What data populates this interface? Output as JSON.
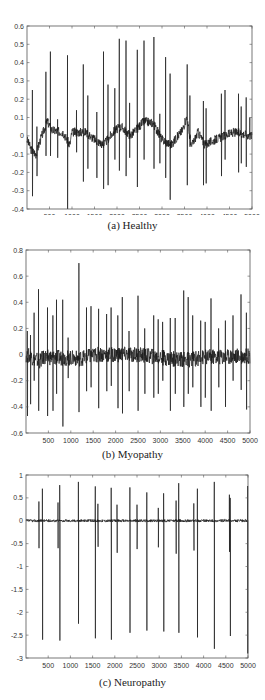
{
  "chart_data": [
    {
      "type": "line",
      "title": "",
      "caption": "(a) Healthy",
      "xlabel": "",
      "ylabel": "",
      "xlim": [
        0,
        5000
      ],
      "ylim": [
        -0.4,
        0.6
      ],
      "xticks": [
        500,
        1000,
        1500,
        2000,
        2500,
        3000,
        3500,
        4000,
        4500,
        5000
      ],
      "yticks": [
        -0.4,
        -0.3,
        -0.2,
        -0.1,
        0,
        0.1,
        0.2,
        0.3,
        0.4,
        0.5,
        0.6
      ],
      "ytick_labels": [
        "-0.4",
        "-0.3",
        "-0.2",
        "-0.1",
        "0",
        "0.1",
        "0.2",
        "0.3",
        "0.4",
        "0.5",
        "0.6"
      ],
      "grid": false,
      "baseline_drift": [
        [
          0,
          -0.02
        ],
        [
          100,
          -0.08
        ],
        [
          200,
          -0.1
        ],
        [
          300,
          -0.02
        ],
        [
          450,
          0.08
        ],
        [
          550,
          0.03
        ],
        [
          800,
          0.02
        ],
        [
          950,
          -0.05
        ],
        [
          1000,
          0.02
        ],
        [
          1300,
          0.02
        ],
        [
          1500,
          -0.02
        ],
        [
          1700,
          -0.05
        ],
        [
          1950,
          0.03
        ],
        [
          2100,
          0.05
        ],
        [
          2300,
          0.0
        ],
        [
          2600,
          0.08
        ],
        [
          2800,
          0.07
        ],
        [
          3000,
          -0.02
        ],
        [
          3200,
          -0.05
        ],
        [
          3450,
          0.03
        ],
        [
          3550,
          0.1
        ],
        [
          3650,
          -0.06
        ],
        [
          3800,
          0.02
        ],
        [
          3950,
          -0.05
        ],
        [
          4100,
          -0.03
        ],
        [
          4300,
          -0.01
        ],
        [
          4600,
          0.02
        ],
        [
          5000,
          0.0
        ]
      ],
      "spikes": [
        {
          "x": 120,
          "peak": 0.25,
          "trough": -0.33
        },
        {
          "x": 220,
          "peak": 0.05,
          "trough": -0.22
        },
        {
          "x": 420,
          "peak": 0.35,
          "trough": -0.11
        },
        {
          "x": 520,
          "peak": 0.46,
          "trough": -0.11
        },
        {
          "x": 680,
          "peak": 0.09,
          "trough": -0.12
        },
        {
          "x": 900,
          "peak": 0.44,
          "trough": -0.4
        },
        {
          "x": 1100,
          "peak": 0.14,
          "trough": -0.09
        },
        {
          "x": 1250,
          "peak": 0.39,
          "trough": -0.25
        },
        {
          "x": 1350,
          "peak": 0.22,
          "trough": -0.18
        },
        {
          "x": 1550,
          "peak": 0.13,
          "trough": -0.23
        },
        {
          "x": 1700,
          "peak": 0.46,
          "trough": -0.29
        },
        {
          "x": 1800,
          "peak": 0.28,
          "trough": -0.27
        },
        {
          "x": 1950,
          "peak": 0.26,
          "trough": -0.13
        },
        {
          "x": 2050,
          "peak": 0.53,
          "trough": -0.19
        },
        {
          "x": 2200,
          "peak": 0.52,
          "trough": -0.22
        },
        {
          "x": 2280,
          "peak": 0.18,
          "trough": -0.12
        },
        {
          "x": 2450,
          "peak": 0.47,
          "trough": -0.28
        },
        {
          "x": 2600,
          "peak": 0.52,
          "trough": -0.13
        },
        {
          "x": 2820,
          "peak": 0.54,
          "trough": -0.18
        },
        {
          "x": 2950,
          "peak": 0.12,
          "trough": -0.15
        },
        {
          "x": 3080,
          "peak": 0.43,
          "trough": -0.23
        },
        {
          "x": 3180,
          "peak": 0.34,
          "trough": -0.35
        },
        {
          "x": 3560,
          "peak": 0.39,
          "trough": -0.27
        },
        {
          "x": 3620,
          "peak": 0.22,
          "trough": -0.06
        },
        {
          "x": 3920,
          "peak": 0.19,
          "trough": -0.27
        },
        {
          "x": 3980,
          "peak": 0.15,
          "trough": -0.26
        },
        {
          "x": 4320,
          "peak": 0.23,
          "trough": -0.22
        },
        {
          "x": 4400,
          "peak": 0.25,
          "trough": -0.13
        },
        {
          "x": 4700,
          "peak": 0.23,
          "trough": -0.2
        },
        {
          "x": 4760,
          "peak": 0.16,
          "trough": -0.15
        },
        {
          "x": 4870,
          "peak": 0.21,
          "trough": -0.17
        },
        {
          "x": 4950,
          "peak": 0.1,
          "trough": -0.02
        }
      ],
      "noise": 0.025
    },
    {
      "type": "line",
      "title": "",
      "caption": "(b) Myopathy",
      "xlabel": "",
      "ylabel": "",
      "xlim": [
        0,
        5000
      ],
      "ylim": [
        -0.6,
        0.8
      ],
      "xticks": [
        500,
        1000,
        1500,
        2000,
        2500,
        3000,
        3500,
        4000,
        4500,
        5000
      ],
      "yticks": [
        -0.6,
        -0.4,
        -0.2,
        0,
        0.2,
        0.4,
        0.6,
        0.8
      ],
      "ytick_labels": [
        "-0.6",
        "-0.4",
        "-0.2",
        "0",
        "0.2",
        "0.4",
        "0.6",
        "0.8"
      ],
      "grid": false,
      "baseline_drift": [
        [
          0,
          0
        ],
        [
          300,
          -0.05
        ],
        [
          400,
          -0.02
        ],
        [
          1200,
          -0.03
        ],
        [
          1600,
          0
        ],
        [
          2500,
          0.0
        ],
        [
          3200,
          -0.03
        ],
        [
          3600,
          -0.04
        ],
        [
          4000,
          -0.02
        ],
        [
          5000,
          -0.01
        ]
      ],
      "spikes": [
        {
          "x": 30,
          "peak": 0.18,
          "trough": -0.47
        },
        {
          "x": 100,
          "peak": 0.15,
          "trough": -0.38
        },
        {
          "x": 180,
          "peak": 0.32,
          "trough": -0.2
        },
        {
          "x": 280,
          "peak": 0.5,
          "trough": -0.43
        },
        {
          "x": 480,
          "peak": 0.36,
          "trough": -0.47
        },
        {
          "x": 600,
          "peak": 0.3,
          "trough": -0.43
        },
        {
          "x": 680,
          "peak": 0.42,
          "trough": -0.3
        },
        {
          "x": 820,
          "peak": 0.42,
          "trough": -0.55
        },
        {
          "x": 940,
          "peak": 0.13,
          "trough": -0.18
        },
        {
          "x": 1180,
          "peak": 0.7,
          "trough": -0.44
        },
        {
          "x": 1350,
          "peak": 0.36,
          "trough": -0.28
        },
        {
          "x": 1450,
          "peak": 0.37,
          "trough": -0.25
        },
        {
          "x": 1620,
          "peak": 0.35,
          "trough": -0.41
        },
        {
          "x": 1800,
          "peak": 0.31,
          "trough": -0.28
        },
        {
          "x": 1900,
          "peak": 0.36,
          "trough": -0.24
        },
        {
          "x": 2050,
          "peak": 0.3,
          "trough": -0.41
        },
        {
          "x": 2150,
          "peak": 0.44,
          "trough": -0.45
        },
        {
          "x": 2300,
          "peak": 0.18,
          "trough": -0.28
        },
        {
          "x": 2500,
          "peak": 0.45,
          "trough": -0.43
        },
        {
          "x": 2650,
          "peak": 0.2,
          "trough": -0.3
        },
        {
          "x": 2850,
          "peak": 0.3,
          "trough": -0.33
        },
        {
          "x": 2950,
          "peak": 0.27,
          "trough": -0.3
        },
        {
          "x": 3050,
          "peak": 0.25,
          "trough": -0.2
        },
        {
          "x": 3220,
          "peak": 0.28,
          "trough": -0.43
        },
        {
          "x": 3330,
          "peak": 0.28,
          "trough": -0.3
        },
        {
          "x": 3520,
          "peak": 0.49,
          "trough": -0.4
        },
        {
          "x": 3620,
          "peak": 0.44,
          "trough": -0.3
        },
        {
          "x": 3720,
          "peak": 0.3,
          "trough": -0.25
        },
        {
          "x": 3900,
          "peak": 0.26,
          "trough": -0.4
        },
        {
          "x": 4000,
          "peak": 0.25,
          "trough": -0.33
        },
        {
          "x": 4130,
          "peak": 0.43,
          "trough": -0.43
        },
        {
          "x": 4300,
          "peak": 0.2,
          "trough": -0.25
        },
        {
          "x": 4450,
          "peak": 0.26,
          "trough": -0.4
        },
        {
          "x": 4620,
          "peak": 0.3,
          "trough": -0.2
        },
        {
          "x": 4800,
          "peak": 0.46,
          "trough": -0.27
        },
        {
          "x": 4920,
          "peak": 0.32,
          "trough": -0.42
        }
      ],
      "noise": 0.06
    },
    {
      "type": "line",
      "title": "",
      "caption": "(c) Neuropathy",
      "xlabel": "",
      "ylabel": "",
      "xlim": [
        0,
        5000
      ],
      "ylim": [
        -3,
        1
      ],
      "xticks": [
        500,
        1000,
        1500,
        2000,
        2500,
        3000,
        3500,
        4000,
        4500,
        5000
      ],
      "yticks": [
        -3,
        -2.5,
        -2,
        -1.5,
        -1,
        -0.5,
        0,
        0.5,
        1
      ],
      "ytick_labels": [
        "-3",
        "-2.5",
        "-2",
        "-1.5",
        "-1",
        "-0.5",
        "0",
        "0.5",
        "1"
      ],
      "grid": false,
      "baseline_drift": [
        [
          0,
          0
        ],
        [
          5000,
          0
        ]
      ],
      "spikes": [
        {
          "x": 290,
          "peak": 0.42,
          "trough": -0.6
        },
        {
          "x": 370,
          "peak": 0.7,
          "trough": -2.6
        },
        {
          "x": 720,
          "peak": 0.4,
          "trough": -0.6
        },
        {
          "x": 760,
          "peak": 0.78,
          "trough": -2.62
        },
        {
          "x": 1180,
          "peak": 0.85,
          "trough": -2.25
        },
        {
          "x": 1560,
          "peak": 0.75,
          "trough": -2.57
        },
        {
          "x": 1620,
          "peak": 0.37,
          "trough": -0.57
        },
        {
          "x": 1920,
          "peak": 0.72,
          "trough": -2.6
        },
        {
          "x": 2050,
          "peak": 0.35,
          "trough": -0.7
        },
        {
          "x": 2340,
          "peak": 0.73,
          "trough": -2.45
        },
        {
          "x": 2500,
          "peak": 0.35,
          "trough": -0.62
        },
        {
          "x": 2720,
          "peak": 0.62,
          "trough": -2.4
        },
        {
          "x": 2980,
          "peak": 0.28,
          "trough": -0.58
        },
        {
          "x": 3100,
          "peak": 0.6,
          "trough": -2.42
        },
        {
          "x": 3380,
          "peak": 0.44,
          "trough": -0.72
        },
        {
          "x": 3440,
          "peak": 0.82,
          "trough": -2.45
        },
        {
          "x": 3780,
          "peak": 0.38,
          "trough": -0.65
        },
        {
          "x": 3860,
          "peak": 0.7,
          "trough": -2.55
        },
        {
          "x": 4240,
          "peak": 0.85,
          "trough": -2.8
        },
        {
          "x": 4580,
          "peak": 0.57,
          "trough": -0.68
        },
        {
          "x": 4600,
          "peak": 0.5,
          "trough": -2.52
        },
        {
          "x": 4990,
          "peak": 0.76,
          "trough": -2.9
        }
      ],
      "noise": 0.03
    }
  ]
}
